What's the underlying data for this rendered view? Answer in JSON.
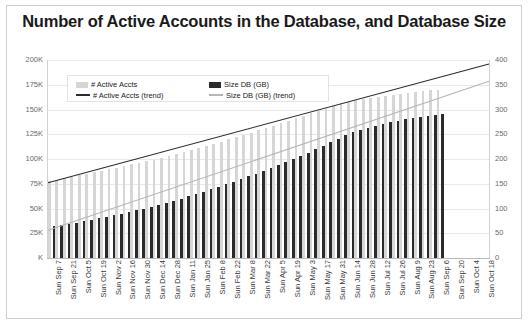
{
  "chart_data": {
    "type": "bar",
    "title": "Number of Active Accounts in the Database, and Database Size",
    "xlabel": "",
    "ylabel": "",
    "grid": true,
    "legend_position": "top-left-inside",
    "axes": {
      "left": {
        "ticks": [
          "K",
          "25K",
          "50K",
          "75K",
          "100K",
          "125K",
          "150K",
          "175K",
          "200K"
        ],
        "ylim": [
          0,
          200000
        ],
        "unit": "accounts"
      },
      "right": {
        "ticks": [
          "0",
          "50",
          "100",
          "150",
          "200",
          "250",
          "300",
          "350",
          "400"
        ],
        "ylim": [
          0,
          400
        ],
        "unit": "GB"
      }
    },
    "legend": [
      {
        "label": "# Active Accts",
        "type": "box",
        "color": "#d6d6d6"
      },
      {
        "label": "Size DB (GB)",
        "type": "box",
        "color": "#2b2b2b"
      },
      {
        "label": "# Active Accts (trend)",
        "type": "line",
        "color": "#2b2b2b"
      },
      {
        "label": "Size DB (GB) (trend)",
        "type": "line",
        "color": "#b5b5b5"
      }
    ],
    "categories": [
      "Sun Sep 7",
      "Sun Sep 14",
      "Sun Sep 21",
      "Sun Sep 28",
      "Sun Oct 5",
      "Sun Oct 12",
      "Sun Oct 19",
      "Sun Oct 26",
      "Sun Nov 2",
      "Sun Nov 9",
      "Sun Nov 16",
      "Sun Nov 23",
      "Sun Nov 30",
      "Sun Dec 7",
      "Sun Dec 14",
      "Sun Dec 21",
      "Sun Dec 28",
      "Sun Jan 4",
      "Sun Jan 11",
      "Sun Jan 18",
      "Sun Jan 25",
      "Sun Feb 1",
      "Sun Feb 8",
      "Sun Feb 15",
      "Sun Feb 22",
      "Sun Mar 1",
      "Sun Mar 8",
      "Sun Mar 15",
      "Sun Mar 22",
      "Sun Mar 29",
      "Sun Apr 5",
      "Sun Apr 12",
      "Sun Apr 19",
      "Sun Apr 26",
      "Sun May 3",
      "Sun May 10",
      "Sun May 17",
      "Sun May 24",
      "Sun May 31",
      "Sun Jun 7",
      "Sun Jun 14",
      "Sun Jun 21",
      "Sun Jun 28",
      "Sun Jul 5",
      "Sun Jul 12",
      "Sun Jul 19",
      "Sun Jul 26",
      "Sun Aug 2",
      "Sun Aug 9",
      "Sun Aug 16",
      "Sun Aug 23",
      "Sun Aug 30",
      "Sun Sep 6",
      "Sun Sep 13",
      "Sun Sep 20",
      "Sun Sep 27",
      "Sun Oct 4",
      "Sun Oct 11",
      "Sun Oct 18"
    ],
    "visible_x_tick_labels": [
      "Sun Sep 7",
      "Sun Sep 21",
      "Sun Oct 5",
      "Sun Oct 19",
      "Sun Nov 2",
      "Sun Nov 16",
      "Sun Nov 30",
      "Sun Dec 14",
      "Sun Dec 28",
      "Sun Jan 11",
      "Sun Jan 25",
      "Sun Feb 8",
      "Sun Feb 22",
      "Sun Mar 8",
      "Sun Mar 22",
      "Sun Apr 5",
      "Sun Apr 19",
      "Sun May 3",
      "Sun May 17",
      "Sun May 31",
      "Sun Jun 14",
      "Sun Jun 28",
      "Sun Jul 12",
      "Sun Jul 26",
      "Sun Aug 9",
      "Sun Aug 23",
      "Sun Sep 6",
      "Sun Sep 20",
      "Sun Oct 4",
      "Sun Oct 18"
    ],
    "series": [
      {
        "name": "# Active Accts",
        "axis": "left",
        "type": "bar",
        "color": "#d6d6d6",
        "values": [
          78000,
          79000,
          80500,
          82000,
          83500,
          85000,
          86500,
          88000,
          89500,
          91000,
          92500,
          94500,
          96000,
          98000,
          99500,
          101500,
          103500,
          105500,
          107500,
          109500,
          111500,
          113500,
          115500,
          117500,
          120000,
          122000,
          124500,
          126500,
          129000,
          131000,
          133500,
          136000,
          138500,
          141000,
          143500,
          146000,
          148500,
          151000,
          153500,
          156000,
          158000,
          159500,
          160500,
          161500,
          162500,
          163500,
          164500,
          165500,
          166500,
          167500,
          168500,
          169500,
          170000,
          null,
          null,
          null,
          null,
          null,
          null
        ]
      },
      {
        "name": "Size DB (GB)",
        "axis": "right",
        "type": "bar",
        "color": "#2b2b2b",
        "values": [
          64,
          66,
          68,
          71,
          74,
          77,
          80,
          83,
          86,
          89,
          93,
          96,
          100,
          104,
          108,
          112,
          116,
          120,
          125,
          129,
          134,
          139,
          144,
          149,
          154,
          159,
          165,
          170,
          176,
          182,
          188,
          194,
          200,
          207,
          213,
          220,
          227,
          234,
          241,
          248,
          254,
          259,
          263,
          267,
          271,
          274,
          277,
          280,
          283,
          285,
          287,
          289,
          291,
          null,
          null,
          null,
          null,
          null,
          null
        ]
      },
      {
        "name": "# Active Accts (trend)",
        "axis": "left",
        "type": "line",
        "color": "#2b2b2b",
        "start_value": 76000,
        "end_value": 196000
      },
      {
        "name": "Size DB (GB) (trend)",
        "axis": "right",
        "type": "line",
        "color": "#b5b5b5",
        "start_value": 56,
        "end_value": 357
      }
    ]
  }
}
